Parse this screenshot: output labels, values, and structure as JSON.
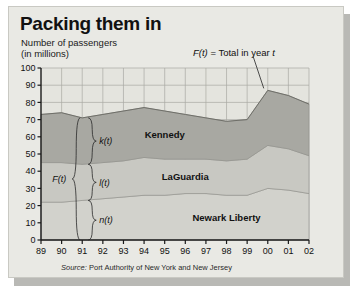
{
  "panel": {
    "title": "Packing them in",
    "subtitle_line1": "Number of passengers",
    "subtitle_line2": "(in millions)",
    "legend_note": "F(t)  =  Total in year t",
    "source_label": "Source:",
    "source_text": "Port Authority of New York and New Jersey"
  },
  "colors": {
    "panel_bg": "#e9e9e4",
    "plot_bg": "#e4e4de",
    "kennedy": "#a8a8a2",
    "laguardia": "#c8c8c2",
    "newark": "#d2d2cc",
    "grid": "#a9a9a3",
    "axis": "#1a1a1a",
    "shadow": "#b9b9b5"
  },
  "annotations": {
    "total_brace": "F(t)",
    "kennedy_brace": "k(t)",
    "laguardia_brace": "l(t)",
    "newark_brace": "n(t)",
    "brace_year": "91"
  },
  "chart_data": {
    "type": "area",
    "title": "Packing them in",
    "subtitle": "Number of passengers (in millions)",
    "xlabel": "",
    "ylabel": "Number of passengers (in millions)",
    "grid": true,
    "stacked": true,
    "legend_position": "in-plot",
    "ylim": [
      0,
      100
    ],
    "ytick_labels": [
      "0",
      "10",
      "20",
      "30",
      "40",
      "50",
      "60",
      "70",
      "80",
      "90",
      "100"
    ],
    "ytick_values": [
      0,
      10,
      20,
      30,
      40,
      50,
      60,
      70,
      80,
      90,
      100
    ],
    "categories": [
      "89",
      "90",
      "91",
      "92",
      "93",
      "94",
      "95",
      "96",
      "97",
      "98",
      "99",
      "00",
      "01",
      "02"
    ],
    "x": [
      1989,
      1990,
      1991,
      1992,
      1993,
      1994,
      1995,
      1996,
      1997,
      1998,
      1999,
      2000,
      2001,
      2002
    ],
    "series": [
      {
        "name": "Newark Liberty",
        "key": "n",
        "color": "#d2d2cc",
        "values": [
          22,
          22,
          23,
          24,
          25,
          26,
          26,
          27,
          27,
          26,
          26,
          30,
          29,
          27
        ]
      },
      {
        "name": "LaGuardia",
        "key": "l",
        "color": "#c8c8c2",
        "values": [
          23,
          23,
          21,
          21,
          21,
          22,
          21,
          20,
          20,
          20,
          21,
          25,
          24,
          22
        ]
      },
      {
        "name": "Kennedy",
        "key": "k",
        "color": "#a8a8a2",
        "values": [
          28,
          29,
          27,
          28,
          29,
          29,
          28,
          26,
          24,
          23,
          23,
          32,
          31,
          30
        ]
      }
    ],
    "total_series": {
      "name": "F(t) = Total in year t",
      "values": [
        73,
        74,
        71,
        73,
        75,
        77,
        75,
        73,
        71,
        69,
        70,
        87,
        84,
        79
      ]
    },
    "annotations": [
      {
        "text": "F(t) = Total in year t",
        "type": "callout",
        "points_to_year": "00"
      },
      {
        "text": "Kennedy",
        "type": "band-label"
      },
      {
        "text": "LaGuardia",
        "type": "band-label"
      },
      {
        "text": "Newark Liberty",
        "type": "band-label"
      },
      {
        "text": "F(t)",
        "type": "brace",
        "at_year": "91"
      },
      {
        "text": "k(t)",
        "type": "brace",
        "at_year": "91"
      },
      {
        "text": "l(t)",
        "type": "brace",
        "at_year": "91"
      },
      {
        "text": "n(t)",
        "type": "brace",
        "at_year": "91"
      }
    ]
  }
}
